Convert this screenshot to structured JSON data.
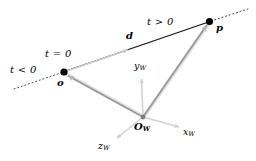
{
  "figure": {
    "background_color": "#ffffff",
    "width": 256,
    "height": 161
  },
  "colors": {
    "ray_line": "#000000",
    "dotted_extension": "#555555",
    "direction_arrow": "#c8c8c8",
    "vector_stroke": "#8c8c8c",
    "vector_highlight": "#d6d6d6",
    "axis": "#cfcfcf",
    "point_fill": "#000000",
    "origin_fill": "#808080",
    "label_text": "#000000"
  },
  "labels": {
    "t_negative": "t < 0",
    "t_zero": "t = 0",
    "t_positive": "t > 0",
    "ray_origin": "o",
    "direction": "d",
    "point": "p",
    "world_origin": "O",
    "world_origin_sub": "W",
    "axis_x": "x",
    "axis_x_sub": "W",
    "axis_y": "y",
    "axis_y_sub": "W",
    "axis_z": "z",
    "axis_z_sub": "W"
  },
  "geometry": {
    "points": {
      "o": [
        64,
        72
      ],
      "d": [
        129,
        48
      ],
      "p": [
        209,
        22
      ],
      "world_origin": [
        143,
        117
      ],
      "x_axis_tip": [
        181,
        128
      ],
      "y_axis_tip": [
        141,
        77
      ],
      "z_axis_tip": [
        116,
        139
      ],
      "ray_back_start": [
        14,
        89
      ],
      "ray_forward_end": [
        246,
        10
      ]
    }
  }
}
